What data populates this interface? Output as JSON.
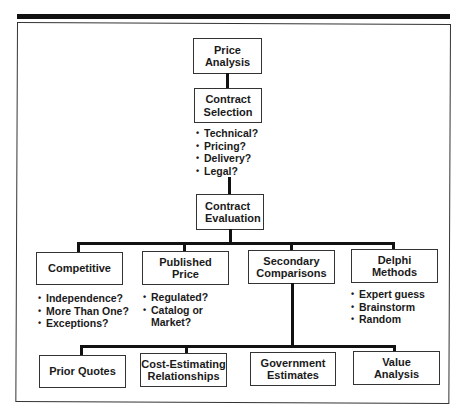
{
  "diagram": {
    "root": {
      "label": "Price\nAnalysis"
    },
    "selection": {
      "label": "Contract\nSelection",
      "criteria": [
        "Technical?",
        "Pricing?",
        "Delivery?",
        "Legal?"
      ]
    },
    "evaluation": {
      "label": "Contract\nEvaluation"
    },
    "methods": [
      {
        "label": "Competitive",
        "notes": [
          "Independence?",
          "More Than One?",
          "Exceptions?"
        ]
      },
      {
        "label": "Published\nPrice",
        "notes": [
          "Regulated?",
          "Catalog or",
          "Market?"
        ]
      },
      {
        "label": "Secondary\nComparisons",
        "notes": []
      },
      {
        "label": "Delphi\nMethods",
        "notes": [
          "Expert guess",
          "Brainstorm",
          "Random"
        ]
      }
    ],
    "secondary_comparisons": [
      {
        "label": "Prior Quotes"
      },
      {
        "label": "Cost-Estimating\nRelationships"
      },
      {
        "label": "Government\nEstimates"
      },
      {
        "label": "Value\nAnalysis"
      }
    ]
  },
  "colors": {
    "line": "#111111",
    "border": "#333333",
    "text": "#1a1a1a",
    "background": "#ffffff"
  }
}
